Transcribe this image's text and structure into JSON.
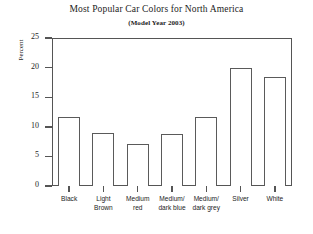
{
  "chart_data": {
    "type": "bar",
    "title": "Most Popular Car Colors for North America",
    "subtitle": "(Model Year 2003)",
    "xlabel": "",
    "ylabel": "Percent",
    "ylim": [
      0,
      25
    ],
    "yticks": [
      0,
      5,
      10,
      15,
      20,
      25
    ],
    "grid": false,
    "legend": false,
    "categories": [
      "Black",
      "Light Brown",
      "Medium red",
      "Medium/dark blue",
      "Medium/dark grey",
      "Silver",
      "White"
    ],
    "category_lines": [
      [
        "Black"
      ],
      [
        "Light",
        "Brown"
      ],
      [
        "Medium",
        "red"
      ],
      [
        "Medium/",
        "dark blue"
      ],
      [
        "Medium/",
        "dark grey"
      ],
      [
        "Silver"
      ],
      [
        "White"
      ]
    ],
    "values": [
      11.6,
      9.0,
      7.1,
      8.8,
      11.6,
      20.0,
      18.4
    ],
    "bar_fill": "#ffffff",
    "bar_edge": "#5a5a5a",
    "axis_color": "#555555",
    "text_color": "#1c1c1c",
    "background": "#ffffff"
  }
}
